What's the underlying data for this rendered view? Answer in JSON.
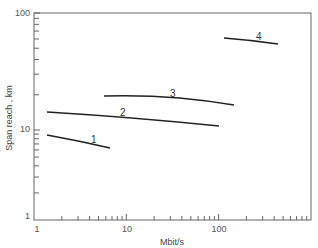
{
  "chart_data": {
    "type": "line",
    "title": "",
    "xlabel": "Mbit/s",
    "ylabel": "Span reach , km",
    "xscale": "log",
    "yscale": "log",
    "xlim": [
      1,
      1000
    ],
    "ylim": [
      1,
      100
    ],
    "x_tick_labels": [
      "1",
      "10",
      "100"
    ],
    "y_tick_labels": [
      "1",
      "10",
      "100"
    ],
    "grid": false,
    "legend": null,
    "series": [
      {
        "name": "1",
        "x": [
          1.4,
          2.5,
          4,
          6.7
        ],
        "values": [
          8.6,
          7.8,
          7.1,
          6.2
        ]
      },
      {
        "name": "2",
        "x": [
          1.4,
          5,
          20,
          100
        ],
        "values": [
          14,
          13,
          12,
          10.6
        ]
      },
      {
        "name": "3",
        "x": [
          7.5,
          20,
          50,
          140
        ],
        "values": [
          19.6,
          19.5,
          18.5,
          16
        ]
      },
      {
        "name": "4",
        "x": [
          120,
          200,
          400
        ],
        "values": [
          61,
          58,
          54
        ]
      }
    ]
  },
  "labels": {
    "xlabel": "Mbit/s",
    "ylabel": "Span reach , km",
    "y100": "100",
    "y10": "10",
    "y1": "1",
    "x1": "1",
    "x10": "10",
    "x100": "100",
    "c1": "1",
    "c2": "2",
    "c3": "3",
    "c4": "4"
  }
}
